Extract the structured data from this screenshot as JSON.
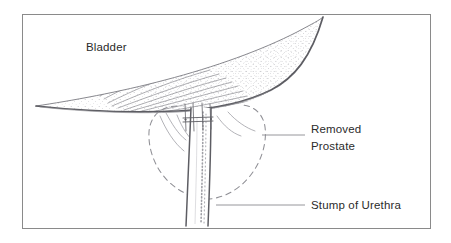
{
  "figure": {
    "kind": "medical-line-illustration",
    "canvas": {
      "width": 451,
      "height": 243
    },
    "background_color": "#ffffff",
    "border": {
      "color": "#8a8a8a",
      "width": 1,
      "x": 22,
      "y": 14,
      "w": 408,
      "h": 214
    },
    "ink_color": "#6e6e72",
    "ink_color_dark": "#55555a",
    "stipple_color": "#9a9aa0",
    "text_color": "#2b2b2b"
  },
  "labels": [
    {
      "id": "bladder",
      "name": "bladder-label",
      "text": "Bladder",
      "x": 86,
      "y": 51,
      "has_leader": false
    },
    {
      "id": "removed_prostate",
      "name": "removed-prostate-label",
      "text_line1": "Removed",
      "text_line2": "Prostate",
      "x": 311,
      "y": 133,
      "line2_y": 150,
      "has_leader": true,
      "leader": {
        "x1": 262,
        "y1": 135,
        "x2": 305,
        "y2": 135
      }
    },
    {
      "id": "stump_of_urethra",
      "name": "stump-of-urethra-label",
      "text": "Stump of Urethra",
      "x": 311,
      "y": 209,
      "has_leader": true,
      "leader": {
        "x1": 216,
        "y1": 205,
        "x2": 305,
        "y2": 205
      }
    }
  ],
  "anatomy": {
    "bladder": {
      "name": "bladder-shape",
      "description": "Large lens-shaped bladder sweeping from lower-left tip up to upper-right, with concentric arc hatching and stipple shading",
      "outline_path": "M 36 106 C 70 101 120 92 165 80 C 215 67 262 50 297 32 C 312 24 320 20 322 18",
      "lower_path": "M 36 106 C 80 110 130 112 176 110 C 215 108 250 100 272 90 C 295 79 312 62 322 18",
      "tip_x": 36,
      "tip_y": 106
    },
    "removed_prostate": {
      "name": "removed-prostate-outline",
      "description": "Dashed heart/shield shaped outline marking the excised prostate bed",
      "dash_pattern": "5,4",
      "bounds": {
        "left": 148,
        "right": 266,
        "top": 104,
        "bottom": 198
      }
    },
    "urethral_stump": {
      "name": "urethral-stump-shape",
      "description": "Vertical tubular urethra descending from bladder neck to bottom of frame, stippled along its right margin",
      "top_y": 108,
      "bottom_y": 226,
      "left_x": 190,
      "right_x": 212
    },
    "sutures": {
      "name": "suture-lines",
      "description": "Four short vertical anastomotic suture strands with two horizontal tie bars at the bladder neck",
      "count": 4,
      "top_y": 105,
      "bottom_y": 130,
      "xs": [
        186,
        194,
        202,
        210
      ]
    }
  }
}
